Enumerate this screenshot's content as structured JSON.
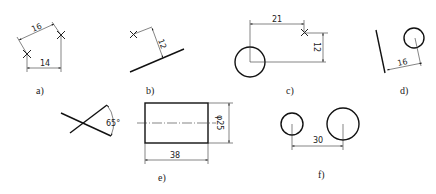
{
  "figures": [
    {
      "label": "a)",
      "dims": [
        "16",
        "14"
      ],
      "description": "two points marked with crosses, aligned dimension 16 and horizontal dimension 14"
    },
    {
      "label": "b)",
      "dims": [
        "12"
      ],
      "description": "distance 12 from a point to an inclined line"
    },
    {
      "label": "c)",
      "dims": [
        "21",
        "12"
      ],
      "description": "point located from circle center by horizontal 21 and vertical 12"
    },
    {
      "label": "d)",
      "dims": [
        "16"
      ],
      "description": "distance 16 from circle center to an inclined line"
    },
    {
      "label": "e)",
      "dims": [
        "65°",
        "φ25",
        "38"
      ],
      "description": "angle 65° between two lines; cylinder with diameter φ25 and length 38"
    },
    {
      "label": "f)",
      "dims": [
        "30"
      ],
      "description": "center distance 30 between two circles"
    }
  ],
  "colors": {
    "line": "#222222",
    "background": "#ffffff"
  }
}
